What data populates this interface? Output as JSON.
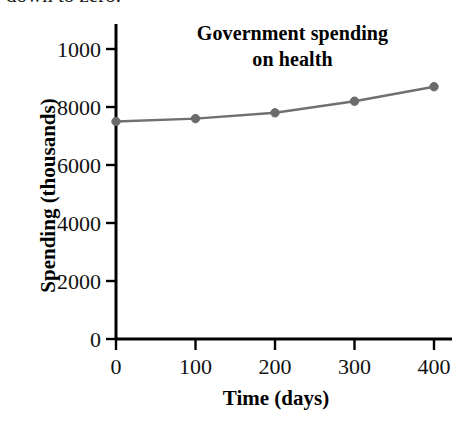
{
  "page": {
    "background": "#ffffff",
    "caption_fragment": "down to zero."
  },
  "chart_data": {
    "type": "line",
    "title": "Government spending on health",
    "title_line_1": "Government spending",
    "title_line_2": "on health",
    "xlabel": "Time (days)",
    "ylabel": "Spending (thousands)",
    "x": [
      0,
      100,
      200,
      300,
      400
    ],
    "values": [
      7500,
      7600,
      7800,
      8200,
      8700
    ],
    "series": [
      {
        "name": "Government spending on health",
        "values": [
          7500,
          7600,
          7800,
          8200,
          8700
        ]
      }
    ],
    "xlim": [
      0,
      400
    ],
    "ylim": [
      0,
      10000
    ],
    "xticks": [
      0,
      100,
      200,
      300,
      400
    ],
    "xtick_labels": [
      "0",
      "100",
      "200",
      "300",
      "400"
    ],
    "yticks": [
      0,
      2000,
      4000,
      6000,
      8000,
      10000
    ],
    "ytick_labels": [
      "0",
      "2000",
      "4000",
      "6000",
      "8000",
      "1000"
    ],
    "grid": false,
    "legend": "none",
    "line_color": "#707070",
    "marker_color": "#6b6b6b",
    "axis_color": "#000000",
    "marker": "circle"
  }
}
